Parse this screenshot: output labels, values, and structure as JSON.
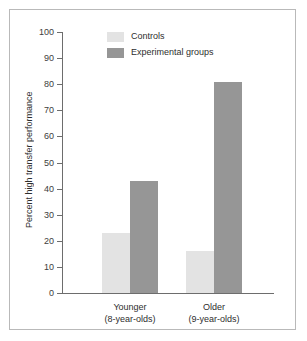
{
  "chart_data": {
    "type": "bar",
    "title": "",
    "xlabel": "",
    "ylabel": "Percent high transfer performance",
    "ylim": [
      0,
      100
    ],
    "ytick_step": 10,
    "grid": false,
    "legend_position": "top-center",
    "categories": [
      "Younger\n(8-year-olds)",
      "Older\n(9-year-olds)"
    ],
    "category_lines": [
      {
        "line1": "Younger",
        "line2": "(8-year-olds)"
      },
      {
        "line1": "Older",
        "line2": "(9-year-olds)"
      }
    ],
    "yticks": [
      "0",
      "10",
      "20",
      "30",
      "40",
      "50",
      "60",
      "70",
      "80",
      "90",
      "100"
    ],
    "series": [
      {
        "name": "Controls",
        "values": [
          23,
          16
        ],
        "color": "#e3e3e3"
      },
      {
        "name": "Experimental groups",
        "values": [
          43,
          81
        ],
        "color": "#969696"
      }
    ]
  },
  "legend": {
    "items": [
      {
        "label": "Controls",
        "color": "#e3e3e3"
      },
      {
        "label": "Experimental groups",
        "color": "#969696"
      }
    ]
  },
  "axes": {
    "y_title": "Percent high transfer performance"
  },
  "colors": {
    "controls": "#e3e3e3",
    "experimental": "#969696",
    "axis": "#6d6d6d",
    "frame": "#b9b9b9",
    "text": "#2e2e2e",
    "background": "#ffffff"
  }
}
